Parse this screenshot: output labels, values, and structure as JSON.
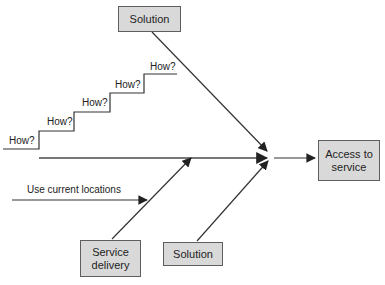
{
  "diagram": {
    "type": "solution-effect-diagram",
    "boxes": {
      "top_solution": "Solution",
      "service_delivery": "Service delivery",
      "bottom_solution": "Solution",
      "access_to_service": "Access to service"
    },
    "how_labels": [
      "How?",
      "How?",
      "How?",
      "How?",
      "How?"
    ],
    "branch_label": "Use current locations",
    "colors": {
      "box_fill": "#d9d9d9",
      "box_border": "#5e5e5e",
      "line": "#333333",
      "spine": "#4a4a4a",
      "text": "#222222",
      "background": "#ffffff"
    }
  }
}
